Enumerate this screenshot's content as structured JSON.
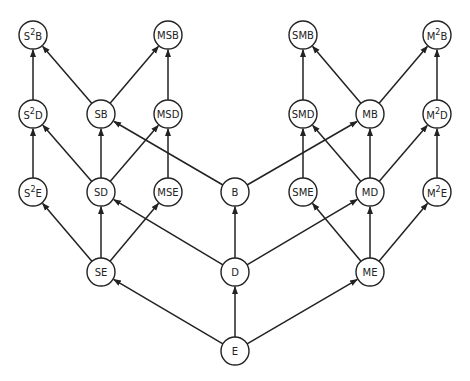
{
  "diagram": {
    "type": "lattice-graph",
    "node_radius": 14,
    "stroke_color": "#222222",
    "background": "#ffffff",
    "nodes": [
      {
        "id": "S2B",
        "base": "S",
        "sup": "2",
        "tail": "B",
        "x": 33,
        "y": 35
      },
      {
        "id": "MSB",
        "label": "MSB",
        "x": 168,
        "y": 35
      },
      {
        "id": "SMB",
        "label": "SMB",
        "x": 303,
        "y": 35
      },
      {
        "id": "M2B",
        "base": "M",
        "sup": "2",
        "tail": "B",
        "x": 437,
        "y": 35
      },
      {
        "id": "S2D",
        "base": "S",
        "sup": "2",
        "tail": "D",
        "x": 33,
        "y": 114
      },
      {
        "id": "SB",
        "label": "SB",
        "x": 101,
        "y": 114
      },
      {
        "id": "MSD",
        "label": "MSD",
        "x": 168,
        "y": 114
      },
      {
        "id": "SMD",
        "label": "SMD",
        "x": 303,
        "y": 114
      },
      {
        "id": "MB",
        "label": "MB",
        "x": 370,
        "y": 114
      },
      {
        "id": "M2D",
        "base": "M",
        "sup": "2",
        "tail": "D",
        "x": 437,
        "y": 114
      },
      {
        "id": "S2E",
        "base": "S",
        "sup": "2",
        "tail": "E",
        "x": 33,
        "y": 192
      },
      {
        "id": "SD",
        "label": "SD",
        "x": 101,
        "y": 192
      },
      {
        "id": "MSE",
        "label": "MSE",
        "x": 168,
        "y": 192
      },
      {
        "id": "B",
        "label": "B",
        "x": 235,
        "y": 192
      },
      {
        "id": "SME",
        "label": "SME",
        "x": 303,
        "y": 192
      },
      {
        "id": "MD",
        "label": "MD",
        "x": 370,
        "y": 192
      },
      {
        "id": "M2E",
        "base": "M",
        "sup": "2",
        "tail": "E",
        "x": 437,
        "y": 192
      },
      {
        "id": "SE",
        "label": "SE",
        "x": 101,
        "y": 272
      },
      {
        "id": "D",
        "label": "D",
        "x": 235,
        "y": 272
      },
      {
        "id": "ME",
        "label": "ME",
        "x": 370,
        "y": 272
      },
      {
        "id": "E",
        "label": "E",
        "x": 235,
        "y": 351
      }
    ],
    "edges": [
      [
        "E",
        "SE"
      ],
      [
        "E",
        "D"
      ],
      [
        "E",
        "ME"
      ],
      [
        "SE",
        "S2E"
      ],
      [
        "SE",
        "SD"
      ],
      [
        "SE",
        "MSE"
      ],
      [
        "D",
        "SD"
      ],
      [
        "D",
        "B"
      ],
      [
        "D",
        "MD"
      ],
      [
        "ME",
        "SME"
      ],
      [
        "ME",
        "MD"
      ],
      [
        "ME",
        "M2E"
      ],
      [
        "S2E",
        "S2D"
      ],
      [
        "SD",
        "S2D"
      ],
      [
        "SD",
        "SB"
      ],
      [
        "SD",
        "MSD"
      ],
      [
        "MSE",
        "MSD"
      ],
      [
        "B",
        "SB"
      ],
      [
        "B",
        "MB"
      ],
      [
        "SME",
        "SMD"
      ],
      [
        "MD",
        "SMD"
      ],
      [
        "MD",
        "MB"
      ],
      [
        "MD",
        "M2D"
      ],
      [
        "M2E",
        "M2D"
      ],
      [
        "S2D",
        "S2B"
      ],
      [
        "SB",
        "S2B"
      ],
      [
        "SB",
        "MSB"
      ],
      [
        "MSD",
        "MSB"
      ],
      [
        "SMD",
        "SMB"
      ],
      [
        "MB",
        "SMB"
      ],
      [
        "MB",
        "M2B"
      ],
      [
        "M2D",
        "M2B"
      ]
    ]
  }
}
